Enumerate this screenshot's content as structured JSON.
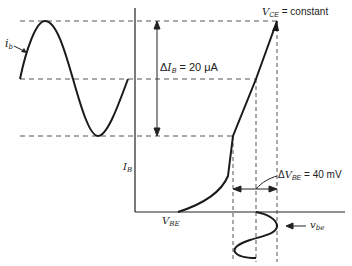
{
  "diagram": {
    "colors": {
      "curve": "#1a1a1a",
      "axis": "#222222",
      "dashed": "#555555",
      "text": "#222222"
    },
    "labels": {
      "ib": {
        "main": "i",
        "sub": "b"
      },
      "delta_ib": {
        "prefix": "Δ",
        "var": "I",
        "sub": "B",
        "value": " = 20 μA"
      },
      "vce": {
        "var": "V",
        "sub": "CE",
        "value": " = constant"
      },
      "ib_axis": {
        "var": "I",
        "sub": "B"
      },
      "vbe_axis": {
        "var": "V",
        "sub": "BE"
      },
      "delta_vbe": {
        "prefix": "Δ",
        "var": "V",
        "sub": "BE",
        "value": " = 40 mV"
      },
      "vbe_signal": {
        "main": "v",
        "sub": "be"
      }
    },
    "annotations": {
      "delta_ib_amount": "20 μA",
      "delta_vbe_amount": "40 mV",
      "condition": "VCE = constant"
    }
  }
}
